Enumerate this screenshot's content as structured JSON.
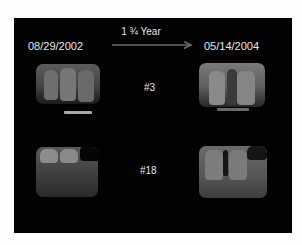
{
  "slide": {
    "start_date": "08/29/2002",
    "end_date": "05/14/2004",
    "interval_label": "1 ¾ Year",
    "rows": [
      {
        "tooth_label": "#3",
        "type": "maxillary"
      },
      {
        "tooth_label": "#18",
        "type": "mandibular"
      }
    ]
  },
  "colors": {
    "background": "#020202",
    "text": "#e8e8e8",
    "arrow": "#6a6a6a"
  }
}
